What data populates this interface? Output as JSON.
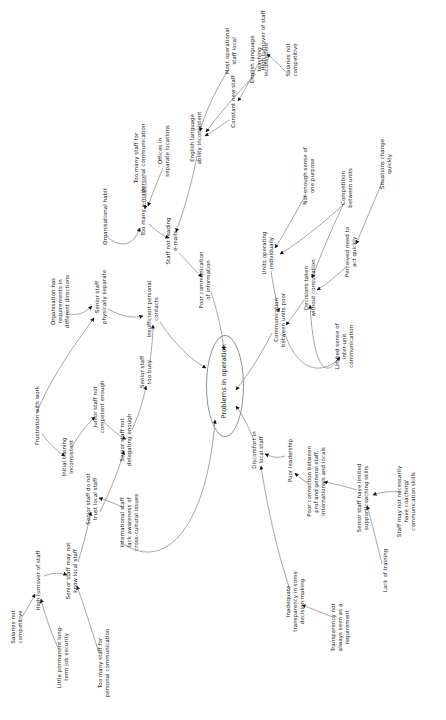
{
  "diagram": {
    "title": "Problems in operation",
    "type": "causal-loop-diagram",
    "orientation": "rotated-90-ccw",
    "background_color": "#ffffff",
    "text_color": "#1a1a1a",
    "edge_color": "#8a8a8a",
    "arrow_color": "#111111",
    "central_node": "Problems in operation",
    "nodes": [
      {
        "id": "problems_in_operation",
        "label": "Problems in operation",
        "x": 224,
        "y": 386,
        "w": 120,
        "shape": "ellipse"
      },
      {
        "id": "poor_communication",
        "label": "Poor communication\nof information",
        "x": 205,
        "y": 282,
        "w": 70
      },
      {
        "id": "staff_not_reading_emails",
        "label": "Staff not reading\ne-mails",
        "x": 172,
        "y": 243,
        "w": 58
      },
      {
        "id": "too_many_emails",
        "label": "Too many e-mails",
        "x": 143,
        "y": 217,
        "w": 64
      },
      {
        "id": "organisational_habit",
        "label": "Organisational habit",
        "x": 105,
        "y": 222,
        "w": 72
      },
      {
        "id": "too_many_staff_personal_comm_top",
        "label": "Too many staff for\npersonal communication",
        "x": 140,
        "y": 160,
        "w": 80
      },
      {
        "id": "offices_separate_locations",
        "label": "Offices in\nseparate locations",
        "x": 164,
        "y": 153,
        "w": 64
      },
      {
        "id": "english_language_ability",
        "label": "English language\nability inconsistent",
        "x": 196,
        "y": 140,
        "w": 66
      },
      {
        "id": "most_operational_staff_local",
        "label": "Most operational\nstaff local",
        "x": 231,
        "y": 53,
        "w": 58
      },
      {
        "id": "english_teaching_inconsistent",
        "label": "English language\nteaching\ninconsistent",
        "x": 259,
        "y": 58,
        "w": 58
      },
      {
        "id": "constant_new_staff",
        "label": "Constant new staff",
        "x": 233,
        "y": 107,
        "w": 68
      },
      {
        "id": "high_turnover_top",
        "label": "High turnover of staff",
        "x": 263,
        "y": 46,
        "w": 74
      },
      {
        "id": "salaries_not_competitive_top",
        "label": "Salaries not\ncompetitive",
        "x": 292,
        "y": 62,
        "w": 54
      },
      {
        "id": "organisation_requirements",
        "label": "Organisation has\nrequirements in\ndifferent directions",
        "x": 60,
        "y": 300,
        "w": 66
      },
      {
        "id": "senior_staff_physically_separate",
        "label": "Senior staff\nphysically separate",
        "x": 101,
        "y": 299,
        "w": 66
      },
      {
        "id": "insufficient_personal_contacts",
        "label": "Insufficient personal\ncontacts",
        "x": 153,
        "y": 311,
        "w": 70
      },
      {
        "id": "senior_staff_too_busy",
        "label": "Senior staff\ntoo busy",
        "x": 146,
        "y": 374,
        "w": 52
      },
      {
        "id": "senior_staff_not_delegating",
        "label": "Senior staff not\ndelegating enough",
        "x": 126,
        "y": 442,
        "w": 66
      },
      {
        "id": "junior_staff_not_competent",
        "label": "Junior staff not\ncompetent enough",
        "x": 99,
        "y": 409,
        "w": 66
      },
      {
        "id": "initial_training_inconsistent",
        "label": "Initial training\ninconsistent",
        "x": 68,
        "y": 459,
        "w": 56
      },
      {
        "id": "frustration_with_work",
        "label": "Frustration with work",
        "x": 37,
        "y": 421,
        "w": 74
      },
      {
        "id": "senior_staff_do_not_trust",
        "label": "Senior staff do not\ntrust local staff",
        "x": 92,
        "y": 501,
        "w": 64
      },
      {
        "id": "international_staff_cross_cultural",
        "label": "International staff\nlack awareness of\ncross-cultural issues",
        "x": 129,
        "y": 521,
        "w": 70
      },
      {
        "id": "senior_staff_may_not_know_local",
        "label": "Senior staff may not\nknow local staff",
        "x": 72,
        "y": 573,
        "w": 72
      },
      {
        "id": "high_turnover_bottom",
        "label": "High turnover of staff",
        "x": 38,
        "y": 586,
        "w": 74
      },
      {
        "id": "salaries_not_competitive_bottom",
        "label": "Salaries not\ncompetitive",
        "x": 17,
        "y": 629,
        "w": 54
      },
      {
        "id": "little_permanent_job_security",
        "label": "Little permanent long-\nterm job security",
        "x": 63,
        "y": 659,
        "w": 74
      },
      {
        "id": "too_many_staff_personal_comm_bottom",
        "label": "Too many staff for\npersonal communication",
        "x": 104,
        "y": 665,
        "w": 80
      },
      {
        "id": "communication_between_units_poor",
        "label": "Communication\nbetween units poor",
        "x": 280,
        "y": 322,
        "w": 68
      },
      {
        "id": "units_operating_individually",
        "label": "Units operating\nindividually",
        "x": 268,
        "y": 255,
        "w": 58
      },
      {
        "id": "not_enough_sense_of_one_purpose",
        "label": "Not enough sense of\none purpose",
        "x": 309,
        "y": 178,
        "w": 72
      },
      {
        "id": "competition_between_units",
        "label": "Competition\nbetween units",
        "x": 347,
        "y": 190,
        "w": 56
      },
      {
        "id": "decisions_without_consultation",
        "label": "Decisions taken\nwithout consultation",
        "x": 310,
        "y": 290,
        "w": 68
      },
      {
        "id": "situations_change_quickly",
        "label": "Situations change\nquickly",
        "x": 386,
        "y": 166,
        "w": 62
      },
      {
        "id": "perceived_need_to_act_quickly",
        "label": "Perceived need to\nact quickly",
        "x": 351,
        "y": 254,
        "w": 62
      },
      {
        "id": "limited_sense_inter_unit",
        "label": "Limited sense of\ninter-unit\ncommunication",
        "x": 344,
        "y": 345,
        "w": 58
      },
      {
        "id": "discomfort_in_local_staff",
        "label": "Discomfort in\nlocal staff",
        "x": 258,
        "y": 452,
        "w": 54
      },
      {
        "id": "poor_leadership",
        "label": "Poor leadership",
        "x": 290,
        "y": 466,
        "w": 62
      },
      {
        "id": "poor_connection_prof_general",
        "label": "Poor connection between\nprof and general staff,\ninternationals and locals",
        "x": 316,
        "y": 480,
        "w": 86
      },
      {
        "id": "senior_staff_limited_support",
        "label": "Senior staff have limited\nsupport/coaching skills",
        "x": 363,
        "y": 500,
        "w": 88
      },
      {
        "id": "staff_may_not_have_coaching",
        "label": "Staff may not necessarily\nhave coaching/\ncommunication skills",
        "x": 406,
        "y": 500,
        "w": 88
      },
      {
        "id": "lack_of_training",
        "label": "Lack of training",
        "x": 385,
        "y": 576,
        "w": 60
      },
      {
        "id": "inadequate_transparency",
        "label": "Inadequate\ntransparency in some\ndecision making",
        "x": 295,
        "y": 600,
        "w": 70
      },
      {
        "id": "transparency_not_requirement",
        "label": "Transparency not\nalways seen as a\nrequirement",
        "x": 340,
        "y": 626,
        "w": 62
      }
    ],
    "edges": [
      {
        "from": "staff_not_reading_emails",
        "to": "poor_communication"
      },
      {
        "from": "too_many_emails",
        "to": "staff_not_reading_emails"
      },
      {
        "from": "organisational_habit",
        "to": "too_many_emails"
      },
      {
        "from": "too_many_staff_personal_comm_top",
        "to": "too_many_emails"
      },
      {
        "from": "offices_separate_locations",
        "to": "too_many_emails"
      },
      {
        "from": "english_language_ability",
        "to": "staff_not_reading_emails"
      },
      {
        "from": "most_operational_staff_local",
        "to": "english_language_ability"
      },
      {
        "from": "english_teaching_inconsistent",
        "to": "english_language_ability"
      },
      {
        "from": "constant_new_staff",
        "to": "english_language_ability"
      },
      {
        "from": "high_turnover_top",
        "to": "constant_new_staff"
      },
      {
        "from": "salaries_not_competitive_top",
        "to": "high_turnover_top"
      },
      {
        "from": "insufficient_personal_contacts",
        "to": "poor_communication"
      },
      {
        "from": "organisation_requirements",
        "to": "senior_staff_physically_separate"
      },
      {
        "from": "senior_staff_physically_separate",
        "to": "insufficient_personal_contacts"
      },
      {
        "from": "senior_staff_too_busy",
        "to": "insufficient_personal_contacts"
      },
      {
        "from": "senior_staff_not_delegating",
        "to": "senior_staff_too_busy"
      },
      {
        "from": "junior_staff_not_competent",
        "to": "senior_staff_not_delegating"
      },
      {
        "from": "senior_staff_do_not_trust",
        "to": "senior_staff_not_delegating"
      },
      {
        "from": "initial_training_inconsistent",
        "to": "junior_staff_not_competent"
      },
      {
        "from": "frustration_with_work",
        "to": "initial_training_inconsistent"
      },
      {
        "from": "international_staff_cross_cultural",
        "to": "senior_staff_do_not_trust"
      },
      {
        "from": "senior_staff_may_not_know_local",
        "to": "senior_staff_do_not_trust"
      },
      {
        "from": "high_turnover_bottom",
        "to": "senior_staff_may_not_know_local"
      },
      {
        "from": "salaries_not_competitive_bottom",
        "to": "high_turnover_bottom"
      },
      {
        "from": "little_permanent_job_security",
        "to": "high_turnover_bottom"
      },
      {
        "from": "too_many_staff_personal_comm_bottom",
        "to": "senior_staff_may_not_know_local"
      },
      {
        "from": "poor_communication",
        "to": "problems_in_operation"
      },
      {
        "from": "communication_between_units_poor",
        "to": "problems_in_operation"
      },
      {
        "from": "units_operating_individually",
        "to": "communication_between_units_poor"
      },
      {
        "from": "not_enough_sense_of_one_purpose",
        "to": "units_operating_individually"
      },
      {
        "from": "competition_between_units",
        "to": "units_operating_individually"
      },
      {
        "from": "competition_between_units",
        "to": "decisions_without_consultation"
      },
      {
        "from": "decisions_without_consultation",
        "to": "communication_between_units_poor"
      },
      {
        "from": "limited_sense_inter_unit",
        "to": "decisions_without_consultation"
      },
      {
        "from": "communication_between_units_poor",
        "to": "limited_sense_inter_unit"
      },
      {
        "from": "perceived_need_to_act_quickly",
        "to": "decisions_without_consultation"
      },
      {
        "from": "situations_change_quickly",
        "to": "perceived_need_to_act_quickly"
      },
      {
        "from": "discomfort_in_local_staff",
        "to": "problems_in_operation"
      },
      {
        "from": "poor_leadership",
        "to": "discomfort_in_local_staff"
      },
      {
        "from": "inadequate_transparency",
        "to": "discomfort_in_local_staff"
      },
      {
        "from": "transparency_not_requirement",
        "to": "inadequate_transparency"
      },
      {
        "from": "poor_connection_prof_general",
        "to": "poor_leadership"
      },
      {
        "from": "senior_staff_limited_support",
        "to": "poor_connection_prof_general"
      },
      {
        "from": "staff_may_not_have_coaching",
        "to": "senior_staff_limited_support"
      },
      {
        "from": "lack_of_training",
        "to": "senior_staff_limited_support"
      }
    ]
  }
}
